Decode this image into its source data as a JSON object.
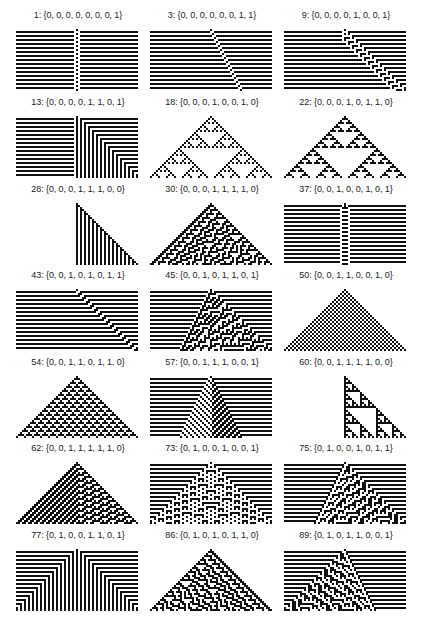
{
  "figure": {
    "layout": {
      "columns": 3,
      "rows": 7
    },
    "panels": [
      {
        "rule": 1,
        "label": "1: {0, 0, 0, 0, 0, 0, 0, 1}"
      },
      {
        "rule": 3,
        "label": "3: {0, 0, 0, 0, 0, 0, 1, 1}"
      },
      {
        "rule": 9,
        "label": "9: {0, 0, 0, 0, 1, 0, 0, 1}"
      },
      {
        "rule": 13,
        "label": "13: {0, 0, 0, 0, 1, 1, 0, 1}"
      },
      {
        "rule": 18,
        "label": "18: {0, 0, 0, 1, 0, 0, 1, 0}"
      },
      {
        "rule": 22,
        "label": "22: {0, 0, 0, 1, 0, 1, 1, 0}"
      },
      {
        "rule": 28,
        "label": "28: {0, 0, 0, 1, 1, 1, 0, 0}"
      },
      {
        "rule": 30,
        "label": "30: {0, 0, 0, 1, 1, 1, 1, 0}"
      },
      {
        "rule": 37,
        "label": "37: {0, 0, 1, 0, 0, 1, 0, 1}"
      },
      {
        "rule": 43,
        "label": "43: {0, 0, 1, 0, 1, 0, 1, 1}"
      },
      {
        "rule": 45,
        "label": "45: {0, 0, 1, 0, 1, 1, 0, 1}"
      },
      {
        "rule": 50,
        "label": "50: {0, 0, 1, 1, 0, 0, 1, 0}"
      },
      {
        "rule": 54,
        "label": "54: {0, 0, 1, 1, 0, 1, 1, 0}"
      },
      {
        "rule": 57,
        "label": "57: {0, 0, 1, 1, 1, 0, 0, 1}"
      },
      {
        "rule": 60,
        "label": "60: {0, 0, 1, 1, 1, 1, 0, 0}"
      },
      {
        "rule": 62,
        "label": "62: {0, 0, 1, 1, 1, 1, 1, 0}"
      },
      {
        "rule": 73,
        "label": "73: {0, 1, 0, 0, 1, 0, 0, 1}"
      },
      {
        "rule": 75,
        "label": "75: {0, 1, 0, 0, 1, 0, 1, 1}"
      },
      {
        "rule": 77,
        "label": "77: {0, 1, 0, 0, 1, 1, 0, 1}"
      },
      {
        "rule": 86,
        "label": "86: {0, 1, 0, 1, 0, 1, 1, 0}"
      },
      {
        "rule": 89,
        "label": "89: {0, 1, 0, 1, 1, 0, 0, 1}"
      }
    ],
    "colors": {
      "on": "#111111",
      "off": "#ffffff",
      "label": "#222222"
    }
  }
}
